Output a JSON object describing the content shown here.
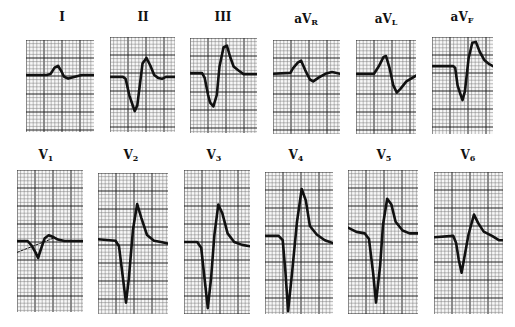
{
  "figure": {
    "grid_color_minor": "#7a7a7a",
    "grid_color_major": "#222222",
    "trace_color": "#111111",
    "paper_color": "#f7f7f7"
  },
  "leads": [
    {
      "id": "I",
      "label": "I",
      "sub": "",
      "x": 26,
      "y": 40,
      "w": 68,
      "h": 92,
      "lx": 62,
      "ly": 10,
      "trace": [
        [
          0,
          0.38
        ],
        [
          0.3,
          0.38
        ],
        [
          0.36,
          0.37
        ],
        [
          0.42,
          0.3
        ],
        [
          0.47,
          0.28
        ],
        [
          0.52,
          0.34
        ],
        [
          0.56,
          0.4
        ],
        [
          0.62,
          0.42
        ],
        [
          0.72,
          0.4
        ],
        [
          0.82,
          0.38
        ],
        [
          1,
          0.38
        ]
      ]
    },
    {
      "id": "II",
      "label": "II",
      "sub": "",
      "x": 110,
      "y": 37,
      "w": 65,
      "h": 95,
      "lx": 143,
      "ly": 10,
      "trace": [
        [
          0,
          0.42
        ],
        [
          0.2,
          0.42
        ],
        [
          0.24,
          0.44
        ],
        [
          0.3,
          0.62
        ],
        [
          0.34,
          0.7
        ],
        [
          0.38,
          0.78
        ],
        [
          0.42,
          0.72
        ],
        [
          0.46,
          0.5
        ],
        [
          0.5,
          0.28
        ],
        [
          0.56,
          0.22
        ],
        [
          0.62,
          0.3
        ],
        [
          0.68,
          0.4
        ],
        [
          0.74,
          0.43
        ],
        [
          0.8,
          0.44
        ],
        [
          0.86,
          0.42
        ],
        [
          1,
          0.42
        ]
      ]
    },
    {
      "id": "III",
      "label": "III",
      "sub": "",
      "x": 190,
      "y": 38,
      "w": 67,
      "h": 95,
      "lx": 223,
      "ly": 10,
      "trace": [
        [
          0,
          0.37
        ],
        [
          0.18,
          0.37
        ],
        [
          0.22,
          0.42
        ],
        [
          0.27,
          0.6
        ],
        [
          0.3,
          0.68
        ],
        [
          0.35,
          0.72
        ],
        [
          0.4,
          0.6
        ],
        [
          0.44,
          0.3
        ],
        [
          0.5,
          0.1
        ],
        [
          0.55,
          0.08
        ],
        [
          0.6,
          0.2
        ],
        [
          0.65,
          0.3
        ],
        [
          0.72,
          0.34
        ],
        [
          0.8,
          0.38
        ],
        [
          1,
          0.38
        ]
      ]
    },
    {
      "id": "aVR",
      "label": "aV",
      "sub": "R",
      "x": 273,
      "y": 40,
      "w": 67,
      "h": 94,
      "lx": 306,
      "ly": 12,
      "trace": [
        [
          0,
          0.36
        ],
        [
          0.26,
          0.35
        ],
        [
          0.3,
          0.3
        ],
        [
          0.37,
          0.24
        ],
        [
          0.42,
          0.22
        ],
        [
          0.48,
          0.32
        ],
        [
          0.55,
          0.42
        ],
        [
          0.6,
          0.44
        ],
        [
          0.68,
          0.4
        ],
        [
          0.78,
          0.36
        ],
        [
          0.88,
          0.34
        ],
        [
          1,
          0.36
        ]
      ]
    },
    {
      "id": "aVL",
      "label": "aV",
      "sub": "L",
      "x": 356,
      "y": 40,
      "w": 60,
      "h": 94,
      "lx": 386,
      "ly": 12,
      "trace": [
        [
          0,
          0.36
        ],
        [
          0.3,
          0.36
        ],
        [
          0.38,
          0.28
        ],
        [
          0.46,
          0.18
        ],
        [
          0.5,
          0.17
        ],
        [
          0.56,
          0.3
        ],
        [
          0.62,
          0.48
        ],
        [
          0.68,
          0.56
        ],
        [
          0.74,
          0.52
        ],
        [
          0.84,
          0.44
        ],
        [
          1,
          0.38
        ]
      ]
    },
    {
      "id": "aVF",
      "label": "aV",
      "sub": "F",
      "x": 432,
      "y": 37,
      "w": 61,
      "h": 97,
      "lx": 462,
      "ly": 10,
      "trace": [
        [
          0,
          0.3
        ],
        [
          0.35,
          0.3
        ],
        [
          0.38,
          0.32
        ],
        [
          0.42,
          0.5
        ],
        [
          0.46,
          0.58
        ],
        [
          0.5,
          0.65
        ],
        [
          0.54,
          0.56
        ],
        [
          0.6,
          0.22
        ],
        [
          0.66,
          0.06
        ],
        [
          0.72,
          0.05
        ],
        [
          0.78,
          0.15
        ],
        [
          0.86,
          0.24
        ],
        [
          0.94,
          0.28
        ],
        [
          1,
          0.3
        ]
      ]
    },
    {
      "id": "V1",
      "label": "V",
      "sub": "1",
      "x": 17,
      "y": 170,
      "w": 66,
      "h": 142,
      "lx": 46,
      "ly": 148,
      "trace": [
        [
          0,
          0.5
        ],
        [
          0.16,
          0.5
        ],
        [
          0.22,
          0.53
        ],
        [
          0.28,
          0.58
        ],
        [
          0.32,
          0.62
        ],
        [
          0.36,
          0.56
        ],
        [
          0.42,
          0.48
        ],
        [
          0.48,
          0.46
        ],
        [
          0.54,
          0.47
        ],
        [
          0.62,
          0.49
        ],
        [
          0.72,
          0.5
        ],
        [
          1,
          0.5
        ]
      ],
      "extra": [
        [
          0,
          0.58
        ],
        [
          0.55,
          0.48
        ]
      ]
    },
    {
      "id": "V2",
      "label": "V",
      "sub": "2",
      "x": 98,
      "y": 173,
      "w": 70,
      "h": 141,
      "lx": 131,
      "ly": 148,
      "trace": [
        [
          0,
          0.47
        ],
        [
          0.25,
          0.48
        ],
        [
          0.3,
          0.52
        ],
        [
          0.35,
          0.72
        ],
        [
          0.4,
          0.92
        ],
        [
          0.44,
          0.75
        ],
        [
          0.5,
          0.4
        ],
        [
          0.56,
          0.22
        ],
        [
          0.62,
          0.32
        ],
        [
          0.7,
          0.44
        ],
        [
          0.8,
          0.48
        ],
        [
          0.9,
          0.49
        ],
        [
          1,
          0.5
        ]
      ]
    },
    {
      "id": "V3",
      "label": "V",
      "sub": "3",
      "x": 184,
      "y": 170,
      "w": 66,
      "h": 144,
      "lx": 214,
      "ly": 148,
      "trace": [
        [
          0,
          0.5
        ],
        [
          0.2,
          0.5
        ],
        [
          0.26,
          0.54
        ],
        [
          0.31,
          0.75
        ],
        [
          0.36,
          0.96
        ],
        [
          0.41,
          0.75
        ],
        [
          0.46,
          0.45
        ],
        [
          0.52,
          0.24
        ],
        [
          0.58,
          0.3
        ],
        [
          0.66,
          0.44
        ],
        [
          0.76,
          0.5
        ],
        [
          0.88,
          0.52
        ],
        [
          1,
          0.53
        ]
      ]
    },
    {
      "id": "V4",
      "label": "V",
      "sub": "4",
      "x": 265,
      "y": 172,
      "w": 68,
      "h": 142,
      "lx": 296,
      "ly": 148,
      "trace": [
        [
          0,
          0.45
        ],
        [
          0.2,
          0.45
        ],
        [
          0.26,
          0.48
        ],
        [
          0.3,
          0.7
        ],
        [
          0.34,
          0.98
        ],
        [
          0.4,
          0.7
        ],
        [
          0.47,
          0.35
        ],
        [
          0.54,
          0.12
        ],
        [
          0.6,
          0.2
        ],
        [
          0.66,
          0.38
        ],
        [
          0.76,
          0.44
        ],
        [
          0.88,
          0.48
        ],
        [
          1,
          0.5
        ]
      ]
    },
    {
      "id": "V5",
      "label": "V",
      "sub": "5",
      "x": 348,
      "y": 170,
      "w": 70,
      "h": 144,
      "lx": 384,
      "ly": 148,
      "trace": [
        [
          0,
          0.4
        ],
        [
          0.12,
          0.43
        ],
        [
          0.24,
          0.44
        ],
        [
          0.3,
          0.48
        ],
        [
          0.36,
          0.72
        ],
        [
          0.4,
          0.92
        ],
        [
          0.46,
          0.66
        ],
        [
          0.5,
          0.38
        ],
        [
          0.56,
          0.2
        ],
        [
          0.62,
          0.24
        ],
        [
          0.68,
          0.36
        ],
        [
          0.78,
          0.42
        ],
        [
          0.88,
          0.44
        ],
        [
          1,
          0.44
        ]
      ]
    },
    {
      "id": "V6",
      "label": "V",
      "sub": "6",
      "x": 434,
      "y": 172,
      "w": 69,
      "h": 142,
      "lx": 468,
      "ly": 148,
      "trace": [
        [
          0,
          0.46
        ],
        [
          0.28,
          0.45
        ],
        [
          0.32,
          0.5
        ],
        [
          0.36,
          0.62
        ],
        [
          0.4,
          0.71
        ],
        [
          0.44,
          0.6
        ],
        [
          0.5,
          0.44
        ],
        [
          0.58,
          0.3
        ],
        [
          0.64,
          0.36
        ],
        [
          0.72,
          0.42
        ],
        [
          0.84,
          0.45
        ],
        [
          0.94,
          0.48
        ],
        [
          1,
          0.48
        ]
      ]
    }
  ]
}
